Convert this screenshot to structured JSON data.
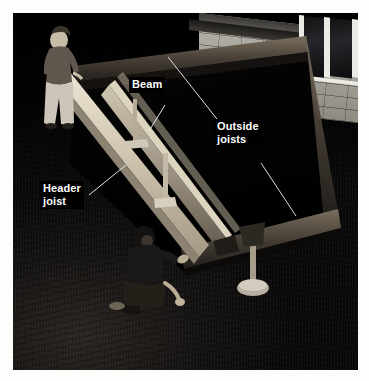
{
  "image": {
    "kind": "photograph",
    "subject": "deck-framing-construction",
    "border_color": "#fdfdfb",
    "photo_background_color": "#070707"
  },
  "scene": {
    "description": "Two workers assembling a wood deck frame on dark soil beside a concrete block house wall with windows",
    "people": [
      {
        "id": "standing-worker",
        "pose": "standing",
        "shirt_color": "#6b6159",
        "pants_color": "#cfc8bb"
      },
      {
        "id": "kneeling-worker",
        "pose": "kneeling",
        "shirt_color": "#1b1a19",
        "pants_color": "#262420"
      }
    ],
    "structure": [
      {
        "id": "header-joist",
        "material": "lumber",
        "color": "#ded5c2"
      },
      {
        "id": "beam",
        "material": "lumber",
        "color": "#cfc5b0"
      },
      {
        "id": "outside-joist-far",
        "material": "lumber",
        "color": "#4a4339"
      },
      {
        "id": "outside-joist-near",
        "material": "lumber",
        "color": "#4a4339"
      },
      {
        "id": "support-post",
        "material": "lumber",
        "color": "#a89d86"
      },
      {
        "id": "concrete-footing",
        "material": "concrete",
        "color": "#b3aca0"
      }
    ],
    "wall": {
      "material": "concrete-block",
      "color": "#a5a29a"
    },
    "window": {
      "frame_color": "#eceae4",
      "glass_color": "#1b1b1e"
    }
  },
  "annotations": {
    "label_text_color": "#ffffff",
    "label_background_color": "#000000",
    "leader_line_color": "#f2f2f2",
    "items": [
      {
        "id": "beam",
        "text": "Beam",
        "x": 129,
        "y": 77
      },
      {
        "id": "outside-joists",
        "text": "Outside\njoists",
        "x": 214,
        "y": 119
      },
      {
        "id": "header-joist",
        "text": "Header\njoist",
        "x": 40,
        "y": 181
      }
    ]
  }
}
